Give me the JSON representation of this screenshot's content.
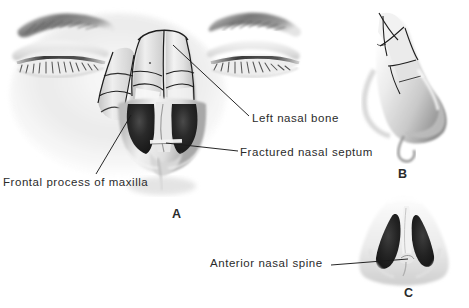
{
  "figure": {
    "background_color": "#ffffff",
    "text_color": "#2b2b2b",
    "type": "medical-illustration"
  },
  "labels": [
    {
      "id": "left-nasal-bone",
      "text": "Left nasal bone"
    },
    {
      "id": "fractured-septum",
      "text": "Fractured nasal septum"
    },
    {
      "id": "frontal-process",
      "text": "Frontal process of maxilla"
    },
    {
      "id": "anterior-spine",
      "text": "Anterior nasal spine"
    }
  ],
  "panels": [
    {
      "id": "a",
      "letter": "A",
      "view": "anterior-frontal-face-with-eyes"
    },
    {
      "id": "b",
      "letter": "B",
      "view": "lateral-nose-profile"
    },
    {
      "id": "c",
      "letter": "C",
      "view": "basal-inferior-nose"
    }
  ]
}
